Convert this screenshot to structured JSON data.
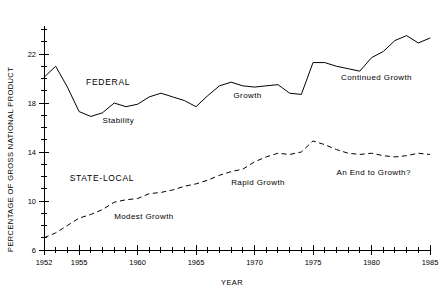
{
  "chart_data": {
    "type": "line",
    "title": "",
    "xlabel": "YEAR",
    "ylabel": "PERCENTAGE OF GROSS NATIONAL PRODUCT",
    "xlim": [
      1952,
      1985
    ],
    "ylim": [
      6,
      24
    ],
    "grid": false,
    "legend_position": "inline-annotations",
    "x_ticks_major": [
      1952,
      1955,
      1960,
      1965,
      1970,
      1975,
      1980,
      1985
    ],
    "x_tick_labels": [
      "1952",
      "1955",
      "1960",
      "1965",
      "1970",
      "1975",
      "1980",
      "1985"
    ],
    "x_tick_minor_step": 1,
    "y_ticks_major": [
      6,
      10,
      14,
      18,
      22
    ],
    "y_tick_labels": [
      "6",
      "10",
      "14",
      "18",
      "22"
    ],
    "y_tick_minor_step": 1,
    "series": [
      {
        "name": "FEDERAL",
        "style": "solid",
        "x": [
          1952,
          1953,
          1954,
          1955,
          1956,
          1957,
          1958,
          1959,
          1960,
          1961,
          1962,
          1963,
          1964,
          1965,
          1966,
          1967,
          1968,
          1969,
          1970,
          1971,
          1972,
          1973,
          1974,
          1975,
          1976,
          1977,
          1978,
          1979,
          1980,
          1981,
          1982,
          1983,
          1984,
          1985
        ],
        "y": [
          20.1,
          21.0,
          19.3,
          17.3,
          16.9,
          17.2,
          18.0,
          17.7,
          17.9,
          18.5,
          18.8,
          18.5,
          18.2,
          17.7,
          18.6,
          19.4,
          19.7,
          19.4,
          19.3,
          19.4,
          19.5,
          18.8,
          18.7,
          21.3,
          21.3,
          21.0,
          20.8,
          20.6,
          21.7,
          22.2,
          23.1,
          23.5,
          22.9,
          23.3
        ]
      },
      {
        "name": "STATE-LOCAL",
        "style": "dashed",
        "x": [
          1952,
          1953,
          1954,
          1955,
          1956,
          1957,
          1958,
          1959,
          1960,
          1961,
          1962,
          1963,
          1964,
          1965,
          1966,
          1967,
          1968,
          1969,
          1970,
          1971,
          1972,
          1973,
          1974,
          1975,
          1976,
          1977,
          1978,
          1979,
          1980,
          1981,
          1982,
          1983,
          1984,
          1985
        ],
        "y": [
          7.0,
          7.4,
          8.0,
          8.6,
          8.9,
          9.3,
          9.9,
          10.1,
          10.2,
          10.6,
          10.7,
          10.9,
          11.2,
          11.4,
          11.7,
          12.1,
          12.4,
          12.6,
          13.2,
          13.6,
          13.9,
          13.8,
          14.0,
          14.9,
          14.6,
          14.2,
          13.9,
          13.8,
          13.9,
          13.7,
          13.6,
          13.7,
          13.9,
          13.8
        ]
      }
    ],
    "annotations": [
      {
        "text": "FEDERAL",
        "x": 1955.6,
        "y": 19.5,
        "kind": "series-name"
      },
      {
        "text": "Stability",
        "x": 1957.0,
        "y": 16.4,
        "kind": "phase"
      },
      {
        "text": "Growth",
        "x": 1968.2,
        "y": 18.4,
        "kind": "phase"
      },
      {
        "text": "Continued Growth",
        "x": 1977.4,
        "y": 19.9,
        "kind": "phase"
      },
      {
        "text": "STATE-LOCAL",
        "x": 1954.2,
        "y": 11.6,
        "kind": "series-name"
      },
      {
        "text": "Modest Growth",
        "x": 1958.0,
        "y": 8.5,
        "kind": "phase"
      },
      {
        "text": "Rapid Growth",
        "x": 1968.0,
        "y": 11.3,
        "kind": "phase"
      },
      {
        "text": "An End to Growth?",
        "x": 1977.0,
        "y": 12.1,
        "kind": "phase"
      }
    ]
  }
}
